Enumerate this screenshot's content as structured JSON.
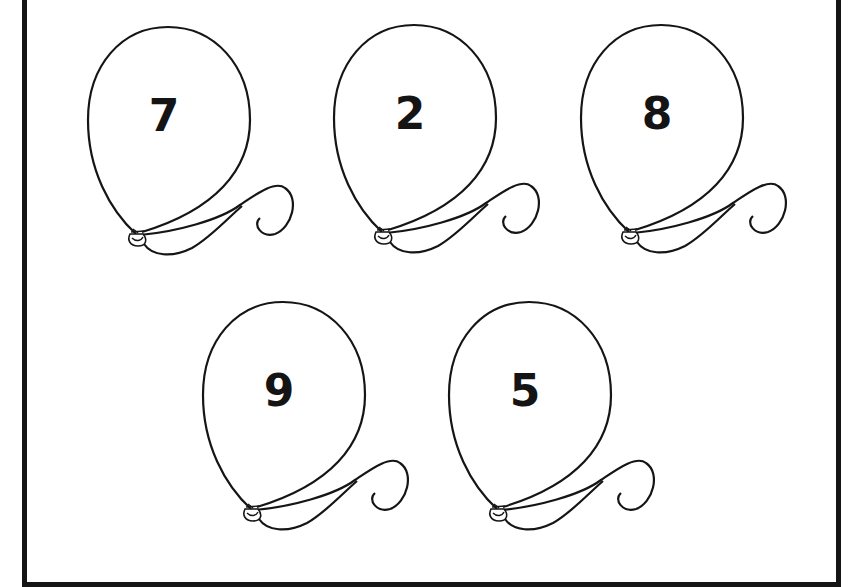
{
  "worksheet": {
    "balloons": [
      {
        "number": "7",
        "x": 80,
        "y": 20
      },
      {
        "number": "2",
        "x": 326,
        "y": 18
      },
      {
        "number": "8",
        "x": 573,
        "y": 18
      },
      {
        "number": "9",
        "x": 195,
        "y": 295
      },
      {
        "number": "5",
        "x": 441,
        "y": 295
      }
    ],
    "colors": {
      "line": "#151515",
      "background": "#ffffff"
    }
  }
}
